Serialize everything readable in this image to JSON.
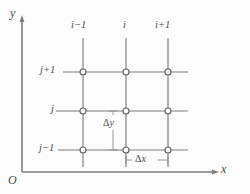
{
  "figure": {
    "background_color": "#fdfdfd",
    "line_color": "#7d7d7d",
    "text_color": "#4a4a4a",
    "node_fill": "#ffffff"
  },
  "axes": {
    "y_label": "y",
    "x_label": "x",
    "origin_label": "O",
    "y_axis": {
      "x": 22,
      "y_top": 20,
      "y_bottom": 172
    },
    "x_axis": {
      "y": 172,
      "x_left": 22,
      "x_right": 215
    }
  },
  "grid": {
    "column_labels": [
      "i−1",
      "i",
      "i+1"
    ],
    "row_labels": [
      "j+1",
      "j",
      "j−1"
    ],
    "column_x": [
      83,
      126,
      168
    ],
    "row_y": [
      72,
      111,
      150
    ],
    "node_radius": 3,
    "node_count": 9,
    "line_extent": {
      "horizontal_left": 63,
      "horizontal_right": 188,
      "vertical_top": 38,
      "vertical_bottom": 167
    }
  },
  "annotations": {
    "delta_y": {
      "symbol": "Δ",
      "variable": "y",
      "text": "Δy",
      "orientation": "vertical",
      "x": 113,
      "y_top": 111,
      "y_bottom": 150
    },
    "delta_x": {
      "symbol": "Δ",
      "variable": "x",
      "text": "Δx",
      "orientation": "horizontal",
      "y": 160,
      "x_left": 126,
      "x_right": 168
    }
  },
  "label_positions": {
    "y_axis_label": {
      "x": 10,
      "y": 8
    },
    "x_axis_label": {
      "x": 221,
      "y": 164
    },
    "origin": {
      "x": 8,
      "y": 175
    },
    "col_0": {
      "x": 71,
      "y": 20
    },
    "col_1": {
      "x": 123,
      "y": 20
    },
    "col_2": {
      "x": 155,
      "y": 20
    },
    "row_0": {
      "x": 40,
      "y": 65
    },
    "row_1": {
      "x": 51,
      "y": 104
    },
    "row_2": {
      "x": 39,
      "y": 143
    },
    "delta_y_label": {
      "x": 103,
      "y": 120
    },
    "delta_x_label": {
      "x": 134,
      "y": 155
    }
  }
}
